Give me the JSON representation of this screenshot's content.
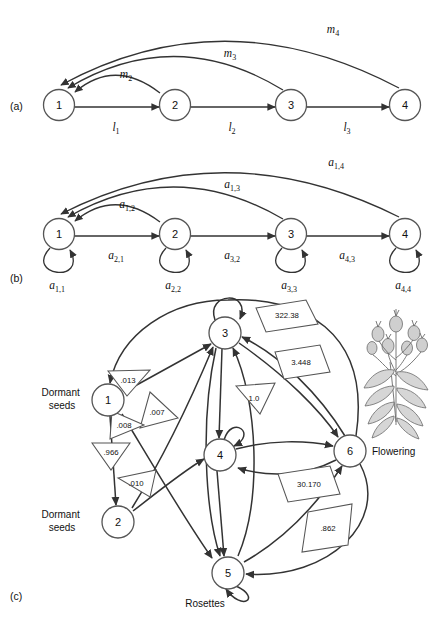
{
  "figure": {
    "panels": [
      {
        "id": "a",
        "label": "(a)"
      },
      {
        "id": "b",
        "label": "(b)"
      },
      {
        "id": "c",
        "label": "(c)"
      }
    ]
  },
  "panel_a": {
    "label": "(a)",
    "nodes": [
      {
        "id": "1",
        "label": "1",
        "x": 59,
        "y": 105
      },
      {
        "id": "2",
        "label": "2",
        "x": 175,
        "y": 105
      },
      {
        "id": "3",
        "label": "3",
        "x": 291,
        "y": 105
      },
      {
        "id": "4",
        "label": "4",
        "x": 405,
        "y": 105
      }
    ],
    "forward_edges": [
      {
        "from": "1",
        "to": "2",
        "label": "l",
        "sub": "1"
      },
      {
        "from": "2",
        "to": "3",
        "label": "l",
        "sub": "2"
      },
      {
        "from": "3",
        "to": "4",
        "label": "l",
        "sub": "3"
      }
    ],
    "return_edges": [
      {
        "from": "2",
        "to": "1",
        "label": "m",
        "sub": "2"
      },
      {
        "from": "3",
        "to": "1",
        "label": "m",
        "sub": "3"
      },
      {
        "from": "4",
        "to": "1",
        "label": "m",
        "sub": "4"
      }
    ]
  },
  "panel_b": {
    "label": "(b)",
    "nodes": [
      {
        "id": "1",
        "label": "1",
        "x": 59,
        "y": 234
      },
      {
        "id": "2",
        "label": "2",
        "x": 175,
        "y": 234
      },
      {
        "id": "3",
        "label": "3",
        "x": 291,
        "y": 234
      },
      {
        "id": "4",
        "label": "4",
        "x": 405,
        "y": 234
      }
    ],
    "forward_edges": [
      {
        "from": "1",
        "to": "2",
        "label": "a",
        "sub": "2,1"
      },
      {
        "from": "2",
        "to": "3",
        "label": "a",
        "sub": "3,2"
      },
      {
        "from": "3",
        "to": "4",
        "label": "a",
        "sub": "4,3"
      }
    ],
    "return_edges": [
      {
        "from": "2",
        "to": "1",
        "label": "a",
        "sub": "1,2"
      },
      {
        "from": "3",
        "to": "1",
        "label": "a",
        "sub": "1,3"
      },
      {
        "from": "4",
        "to": "1",
        "label": "a",
        "sub": "1,4"
      }
    ],
    "self_loops": [
      {
        "node": "1",
        "label": "a",
        "sub": "1,1"
      },
      {
        "node": "2",
        "label": "a",
        "sub": "2,2"
      },
      {
        "node": "3",
        "label": "a",
        "sub": "3,3"
      },
      {
        "node": "4",
        "label": "a",
        "sub": "4,4"
      }
    ]
  },
  "panel_c": {
    "label": "(c)",
    "nodes": [
      {
        "id": "1",
        "label": "1",
        "x": 108,
        "y": 400,
        "stage": "Dormant seeds",
        "stage_x": 62,
        "stage_y": 396
      },
      {
        "id": "2",
        "label": "2",
        "x": 118,
        "y": 522,
        "stage": "Dormant seeds",
        "stage_x": 62,
        "stage_y": 518
      },
      {
        "id": "3",
        "label": "3",
        "x": 225,
        "y": 333,
        "stage": "",
        "stage_x": 0,
        "stage_y": 0
      },
      {
        "id": "4",
        "label": "4",
        "x": 220,
        "y": 455,
        "stage": "",
        "stage_x": 0,
        "stage_y": 0
      },
      {
        "id": "5",
        "label": "5",
        "x": 228,
        "y": 573,
        "stage": "Rosettes",
        "stage_x": 205,
        "stage_y": 604
      },
      {
        "id": "6",
        "label": "6",
        "x": 350,
        "y": 451,
        "stage": "Flowering",
        "stage_x": 398,
        "stage_y": 455
      }
    ],
    "values": [
      {
        "id": "v013",
        "text": ".013",
        "shape": "triangle-down",
        "x": 127,
        "y": 381
      },
      {
        "id": "v007",
        "text": ".007",
        "shape": "triangle-right",
        "x": 158,
        "y": 412
      },
      {
        "id": "v008",
        "text": ".008",
        "shape": "triangle-right",
        "x": 126,
        "y": 425
      },
      {
        "id": "v966",
        "text": ".966",
        "shape": "triangle-down",
        "x": 110,
        "y": 452
      },
      {
        "id": "v010",
        "text": ".010",
        "shape": "triangle-right",
        "x": 136,
        "y": 483
      },
      {
        "id": "v10",
        "text": "1.0",
        "shape": "triangle-down",
        "x": 254,
        "y": 400
      },
      {
        "id": "v32238",
        "text": "322.38",
        "shape": "parallelogram",
        "x": 281,
        "y": 313
      },
      {
        "id": "v3448",
        "text": "3.448",
        "shape": "parallelogram",
        "x": 298,
        "y": 361
      },
      {
        "id": "v30170",
        "text": "30.170",
        "shape": "parallelogram",
        "x": 298,
        "y": 492
      },
      {
        "id": "v862",
        "text": ".862",
        "shape": "parallelogram",
        "x": 320,
        "y": 528
      }
    ],
    "self_loops": [
      "3",
      "4",
      "5"
    ],
    "illustration": "flowering-plant"
  }
}
